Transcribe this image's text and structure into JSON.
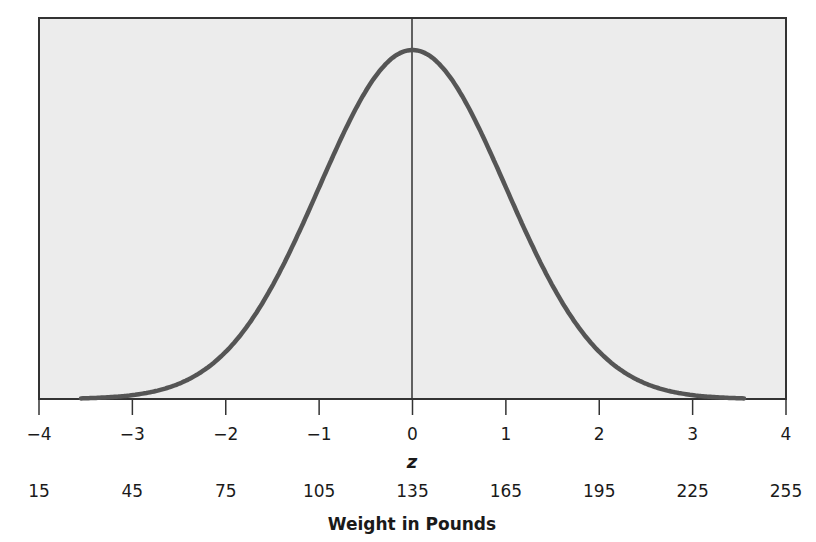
{
  "chart_data": {
    "type": "line",
    "title": "",
    "series": [
      {
        "name": "Normal density",
        "x": [
          -3.5,
          -3,
          -2.5,
          -2,
          -1.5,
          -1,
          -0.5,
          0,
          0.5,
          1,
          1.5,
          2,
          2.5,
          3,
          3.5
        ],
        "values": [
          0.0009,
          0.0044,
          0.0175,
          0.054,
          0.1295,
          0.242,
          0.3521,
          0.3989,
          0.3521,
          0.242,
          0.1295,
          0.054,
          0.0175,
          0.0044,
          0.0009
        ]
      }
    ],
    "xlim": [
      -4,
      4
    ],
    "ylim": [
      0,
      0.42
    ],
    "x_ticks": [
      "-4",
      "-3",
      "-2",
      "-1",
      "0",
      "1",
      "2",
      "3",
      "4"
    ],
    "x_tick_values": [
      -4,
      -3,
      -2,
      -1,
      0,
      1,
      2,
      3,
      4
    ],
    "secondary_x_ticks": [
      "15",
      "45",
      "75",
      "105",
      "135",
      "165",
      "195",
      "225",
      "255"
    ],
    "xlabel": "z",
    "secondary_xlabel": "Weight in Pounds",
    "ylabel": "",
    "mean_line": 0,
    "grid": false,
    "legend": "none",
    "colors": {
      "curve": "#555555",
      "plot_bg": "#ececec",
      "axis": "#333333"
    }
  },
  "labels": {
    "z_ticks": [
      "−4",
      "−3",
      "−2",
      "−1",
      "0",
      "1",
      "2",
      "3",
      "4"
    ],
    "weight_ticks": [
      "15",
      "45",
      "75",
      "105",
      "135",
      "165",
      "195",
      "225",
      "255"
    ],
    "z_axis_title": "z",
    "weight_axis_title": "Weight in Pounds"
  }
}
